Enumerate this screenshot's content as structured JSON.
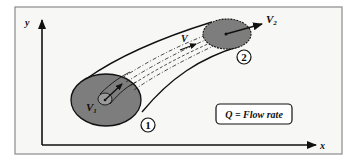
{
  "diagram": {
    "axes": {
      "x_label": "x",
      "y_label": "y"
    },
    "sections": [
      {
        "id": "1",
        "marker_label": "1",
        "velocity_label": "V",
        "velocity_subscript": "1"
      },
      {
        "id": "2",
        "marker_label": "2",
        "velocity_label": "V",
        "velocity_subscript": "2"
      }
    ],
    "streamline_velocity_label": "V",
    "legend_box": {
      "text": "Q = Flow rate"
    },
    "colors": {
      "frame_background": "#f7f7f5",
      "frame_border": "#8a8a8a",
      "section_fill": "#7d7d7d",
      "line": "#111111"
    }
  }
}
